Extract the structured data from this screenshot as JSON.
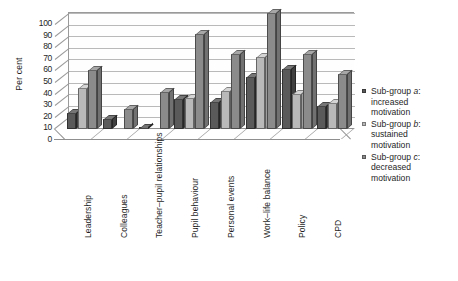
{
  "chart_data": {
    "type": "bar",
    "title": "",
    "xlabel": "",
    "ylabel": "Per cent",
    "ylim": [
      0,
      100
    ],
    "ytick_step": 10,
    "yticks": [
      0,
      10,
      20,
      30,
      40,
      50,
      60,
      70,
      80,
      90,
      100
    ],
    "grid": true,
    "legend_position": "right",
    "style": "3d-clustered-column",
    "categories": [
      "Leadership",
      "Colleagues",
      "Teacher–pupil relationships",
      "Pupil behaviour",
      "Personal events",
      "Work–life balance",
      "Policy",
      "CPD"
    ],
    "series": [
      {
        "name": "Sub-group a: increased motivation",
        "name_prefix": "Sub-group ",
        "name_letter": "a",
        "name_suffix": ": increased motivation",
        "color": "#5a5a5a",
        "values": [
          14,
          9,
          1,
          26,
          23,
          45,
          52,
          20
        ]
      },
      {
        "name": "Sub-group b: sustained motivation",
        "name_prefix": "Sub-group ",
        "name_letter": "b",
        "name_suffix": ": sustained motivation",
        "color": "#b9b9b9",
        "values": [
          35,
          0,
          0,
          27,
          33,
          62,
          30,
          22
        ]
      },
      {
        "name": "Sub-group c: decreased motivation",
        "name_prefix": "Sub-group ",
        "name_letter": "c",
        "name_suffix": ": decreased motivation",
        "color": "#8b8b8b",
        "values": [
          51,
          17,
          32,
          82,
          65,
          100,
          65,
          47
        ]
      }
    ]
  },
  "legend": {
    "items": [
      {
        "line1_prefix": "Sub-group ",
        "line1_letter": "a",
        "line1_suffix": ":",
        "line2": "increased",
        "line3": "motivation",
        "color": "#5a5a5a"
      },
      {
        "line1_prefix": "Sub-group ",
        "line1_letter": "b",
        "line1_suffix": ":",
        "line2": "sustained",
        "line3": "motivation",
        "color": "#b9b9b9"
      },
      {
        "line1_prefix": "Sub-group ",
        "line1_letter": "c",
        "line1_suffix": ":",
        "line2": "decreased",
        "line3": "motivation",
        "color": "#8b8b8b"
      }
    ]
  }
}
